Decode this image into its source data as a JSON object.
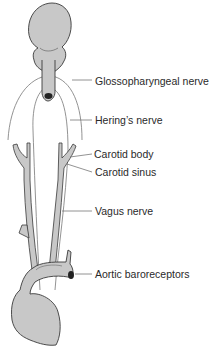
{
  "diagram": {
    "type": "anatomical-illustration",
    "structures": {
      "brain": "brain-stem-medulla",
      "heart": "heart-with-aortic-arch"
    },
    "colors": {
      "fill": "#c8c8c8",
      "stroke": "#3a3a3a",
      "nerve": "#6a6a6a",
      "leader": "#6a6a6a",
      "label_text": "#2a2a2a",
      "background": "#ffffff"
    },
    "labels": [
      {
        "id": "glossopharyngeal",
        "text": "Glossopharyngeal nerve"
      },
      {
        "id": "herings",
        "text": "Hering’s nerve"
      },
      {
        "id": "carotid_body",
        "text": "Carotid body"
      },
      {
        "id": "carotid_sinus",
        "text": "Carotid sinus"
      },
      {
        "id": "vagus",
        "text": "Vagus nerve"
      },
      {
        "id": "aortic",
        "text": "Aortic baroreceptors"
      }
    ]
  }
}
